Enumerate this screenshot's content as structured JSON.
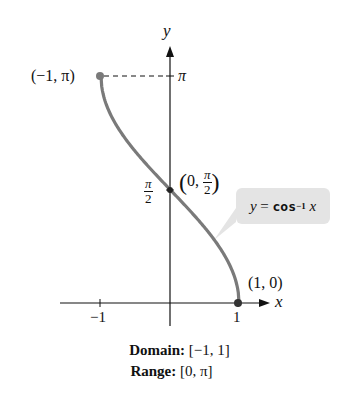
{
  "chart_data": {
    "type": "line",
    "title": "",
    "function_label": "y = cos^-1 x",
    "function_name": "cos",
    "function_exponent": "−1",
    "xlabel": "x",
    "ylabel": "y",
    "x_ticks": [
      "−1",
      "1"
    ],
    "y_ticks": [
      "π/2",
      "π"
    ],
    "xlim": [
      -1,
      1
    ],
    "ylim": [
      0,
      3.1416
    ],
    "grid": false,
    "series": [
      {
        "name": "y = cos^-1 x",
        "x": [
          -1,
          -0.75,
          -0.5,
          -0.25,
          0,
          0.25,
          0.5,
          0.75,
          1
        ],
        "y": [
          3.1416,
          2.4189,
          2.0944,
          1.8235,
          1.5708,
          1.3181,
          1.0472,
          0.7227,
          0
        ]
      }
    ],
    "points": [
      {
        "label": "(−1, π)",
        "x": -1,
        "y": 3.1416
      },
      {
        "label": "(0, π/2)",
        "x": 0,
        "y": 1.5708
      },
      {
        "label": "(1, 0)",
        "x": 1,
        "y": 0
      }
    ],
    "colors": {
      "curve": "#7a7a7a",
      "callout": "#e4e4e4",
      "axis": "#111111"
    }
  },
  "labels": {
    "y_axis": "y",
    "x_axis": "x",
    "pi_tick": "π",
    "half_pi_num": "π",
    "half_pi_den": "2",
    "x_tick_neg1": "−1",
    "x_tick_1": "1",
    "point_top": "(−1, π)",
    "point_mid_prefix": "0,",
    "point_mid_num": "π",
    "point_mid_den": "2",
    "point_bottom": "(1, 0)",
    "callout_y": "y",
    "callout_eq": " = ",
    "callout_fn": "cos",
    "callout_exp": "−1",
    "callout_x": " x"
  },
  "caption": {
    "domain_label": "Domain:",
    "domain_value": "[−1, 1]",
    "range_label": "Range:",
    "range_value": "[0, π]"
  }
}
